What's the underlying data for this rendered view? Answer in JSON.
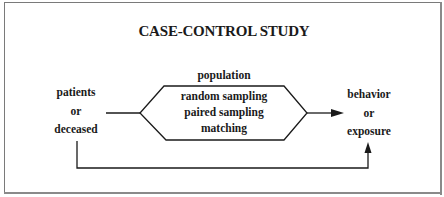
{
  "diagram": {
    "title": "CASE-CONTROL STUDY",
    "top_label": "population",
    "left_node": {
      "lines": [
        "patients",
        "or",
        "deceased"
      ]
    },
    "center_node": {
      "shape": "hexagon",
      "lines": [
        "random sampling",
        "paired sampling",
        "matching"
      ]
    },
    "right_node": {
      "lines": [
        "behavior",
        "or",
        "exposure"
      ]
    },
    "edges": [
      {
        "from": "left_node",
        "to": "center_node",
        "type": "line"
      },
      {
        "from": "center_node",
        "to": "right_node",
        "type": "arrow"
      },
      {
        "from": "left_node",
        "to": "right_node",
        "type": "elbow-arrow",
        "route": "below"
      }
    ],
    "colors": {
      "line": "#1a1a1a",
      "text": "#1a1a1a",
      "frame": "#7a7a7a",
      "background": "#ffffff"
    }
  }
}
